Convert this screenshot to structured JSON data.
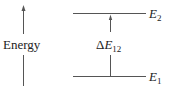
{
  "diagram": {
    "axis_label": "Energy",
    "levels": [
      {
        "name": "E",
        "subscript": "2",
        "y": 13
      },
      {
        "name": "E",
        "subscript": "1",
        "y": 76
      }
    ],
    "gap_label": {
      "prefix": "Δ",
      "name": "E",
      "subscript": "12"
    },
    "colors": {
      "line": "#444444",
      "text": "#222222",
      "background": "#ffffff"
    }
  }
}
